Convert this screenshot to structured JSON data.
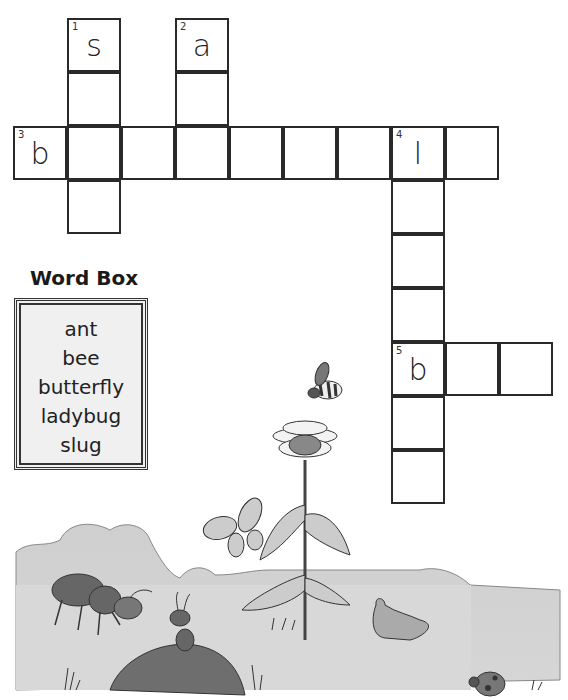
{
  "puzzle": {
    "cells": [
      {
        "row": 0,
        "col": 1,
        "num": "1",
        "letter": "s"
      },
      {
        "row": 0,
        "col": 3,
        "num": "2",
        "letter": "a"
      },
      {
        "row": 1,
        "col": 1
      },
      {
        "row": 1,
        "col": 3
      },
      {
        "row": 2,
        "col": 0,
        "num": "3",
        "letter": "b"
      },
      {
        "row": 2,
        "col": 1
      },
      {
        "row": 2,
        "col": 2
      },
      {
        "row": 2,
        "col": 3
      },
      {
        "row": 2,
        "col": 4
      },
      {
        "row": 2,
        "col": 5
      },
      {
        "row": 2,
        "col": 6
      },
      {
        "row": 2,
        "col": 7,
        "num": "4",
        "letter": "l"
      },
      {
        "row": 2,
        "col": 8
      },
      {
        "row": 3,
        "col": 1
      },
      {
        "row": 3,
        "col": 7
      },
      {
        "row": 4,
        "col": 7
      },
      {
        "row": 5,
        "col": 7
      },
      {
        "row": 6,
        "col": 7,
        "num": "5",
        "letter": "b"
      },
      {
        "row": 6,
        "col": 8
      },
      {
        "row": 6,
        "col": 9
      },
      {
        "row": 7,
        "col": 7
      },
      {
        "row": 8,
        "col": 7
      }
    ]
  },
  "word_box": {
    "title": "Word Box",
    "words": [
      "ant",
      "bee",
      "butterfly",
      "ladybug",
      "slug"
    ]
  },
  "illustration": {
    "elements": [
      "bee-icon",
      "sunflower-icon",
      "butterfly-icon",
      "ant-icon",
      "ant-on-hill-icon",
      "slug-icon",
      "ladybug-icon",
      "bushes",
      "grass"
    ]
  }
}
